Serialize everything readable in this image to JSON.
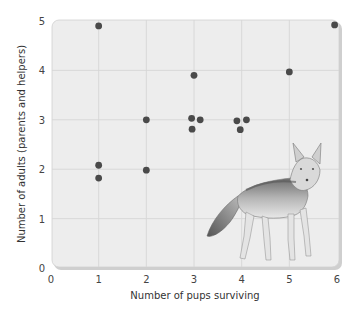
{
  "chart_data": {
    "type": "scatter",
    "title": "",
    "xlabel": "Number of pups surviving",
    "ylabel": "Number of adults (parents and helpers)",
    "xlim": [
      0,
      6
    ],
    "ylim": [
      0,
      5
    ],
    "x_ticks": [
      "0",
      "1",
      "2",
      "3",
      "4",
      "5",
      "6"
    ],
    "y_ticks": [
      "0",
      "1",
      "2",
      "3",
      "4",
      "5"
    ],
    "grid": true,
    "legend": null,
    "series": [
      {
        "name": "Fox groups",
        "color": "#4a4a4a",
        "points": [
          {
            "x": 1,
            "y": 4.9
          },
          {
            "x": 1,
            "y": 2.08
          },
          {
            "x": 1,
            "y": 1.82
          },
          {
            "x": 2,
            "y": 3.0
          },
          {
            "x": 2,
            "y": 1.98
          },
          {
            "x": 3,
            "y": 3.9
          },
          {
            "x": 2.95,
            "y": 3.03
          },
          {
            "x": 3.13,
            "y": 3.0
          },
          {
            "x": 2.96,
            "y": 2.81
          },
          {
            "x": 3.9,
            "y": 2.98
          },
          {
            "x": 4.1,
            "y": 3.0
          },
          {
            "x": 3.97,
            "y": 2.8
          },
          {
            "x": 5,
            "y": 3.97
          },
          {
            "x": 5.95,
            "y": 4.92
          }
        ]
      }
    ],
    "annotations": [
      "fox illustration (lower right of plot)"
    ]
  },
  "colors": {
    "plot_bg": "#ededed",
    "grid": "#d6d6d6",
    "point": "#4a4a4a",
    "frame_shadow": "#c8c8c8"
  }
}
